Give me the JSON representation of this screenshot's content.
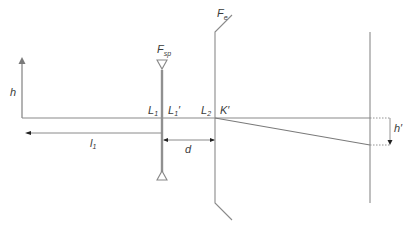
{
  "diagram": {
    "type": "optical-schematic",
    "colors": {
      "line": "#8a8a8a",
      "lens": "#909090",
      "text": "#3a3a3a",
      "arrowhead": "#222222"
    },
    "labels": {
      "h": "h",
      "fsp_main": "F",
      "fsp_sub": "sp",
      "fe_main": "F",
      "fe_sub": "e",
      "l1_main": "L",
      "l1_sub": "1",
      "l1p_main": "L",
      "l1p_sub": "1",
      "l1p_prime": "′",
      "l2_main": "L",
      "l2_sub": "2",
      "k_prime": "K′",
      "d": "d",
      "dist_l1_main": "l",
      "dist_l1_sub": "1",
      "h_prime": "h′"
    }
  }
}
